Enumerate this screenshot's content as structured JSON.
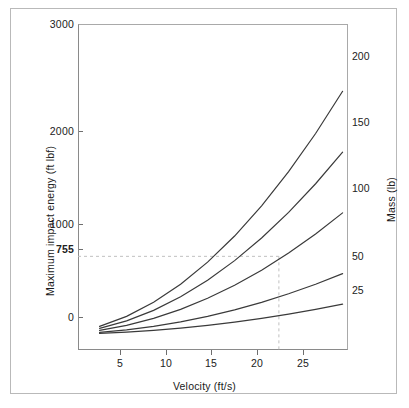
{
  "chart_data": {
    "type": "line",
    "title": "",
    "xlabel": "Velocity (ft/s)",
    "ylabel": "Maximum impact energy (ft lbf)",
    "right_axis_label": "Mass (lb)",
    "xlim": [
      3.0,
      28.0
    ],
    "ylim": [
      -150,
      3000
    ],
    "xticks": [
      5,
      10,
      15,
      20,
      25
    ],
    "yticks": [
      0,
      1000,
      2000,
      3000
    ],
    "extra_yticks": [
      755
    ],
    "grid": false,
    "legend_position": "right-of-axis-curve-labels",
    "x": [
      5,
      7.5,
      10,
      12.5,
      15,
      17.5,
      20,
      22.5,
      25,
      27.5
    ],
    "series": [
      {
        "name": "25",
        "label": "25",
        "mass_lb": 25,
        "values": [
          9.7,
          21.9,
          38.8,
          60.7,
          87.4,
          118.9,
          155.3,
          196.6,
          242.7,
          293.7
        ]
      },
      {
        "name": "50",
        "label": "50",
        "mass_lb": 50,
        "values": [
          19.4,
          43.7,
          77.7,
          121.4,
          174.8,
          237.8,
          310.7,
          393.3,
          485.5,
          587.4
        ]
      },
      {
        "name": "100",
        "label": "100",
        "mass_lb": 100,
        "values": [
          38.8,
          87.4,
          155.3,
          242.7,
          349.5,
          475.6,
          621.4,
          786.5,
          971.0,
          1174.8
        ]
      },
      {
        "name": "150",
        "label": "150",
        "mass_lb": 150,
        "values": [
          58.3,
          131.1,
          233.1,
          364.1,
          524.2,
          713.4,
          932.1,
          1179.8,
          1456.5,
          1762.2
        ]
      },
      {
        "name": "200",
        "label": "200",
        "mass_lb": 200,
        "values": [
          77.7,
          174.8,
          310.7,
          485.5,
          698.9,
          951.2,
          1242.8,
          1573.1,
          1941.9,
          2349.7
        ]
      }
    ],
    "annotations": [
      {
        "name": "energy-guide",
        "type": "dashed-horizontal",
        "y": 755,
        "label": "755",
        "from_x": 3.0,
        "to_x": 21.6
      },
      {
        "name": "velocity-guide",
        "type": "dashed-vertical",
        "x": 21.6,
        "label": "",
        "from_y": 755,
        "to_y": -150
      }
    ],
    "colors": {
      "curve": "#3a3a3a",
      "axis": "#8a8a8a",
      "frame": "#a9a9a9",
      "guide_dashed": "#c0c0c0",
      "text": "#222222",
      "background": "#ffffff",
      "outer_border": "#b9b9b9"
    }
  },
  "axes": {
    "y_tick_labels": [
      "3000",
      "2000",
      "1000",
      "755",
      "0"
    ],
    "x_tick_labels": [
      "5",
      "10",
      "15",
      "20",
      "25"
    ],
    "y_title": "Maximum impact energy (ft lbf)",
    "x_title": "Velocity (ft/s)",
    "right_title": "Mass (lb)",
    "mass_curve_labels": [
      "200",
      "150",
      "100",
      "50",
      "25"
    ]
  }
}
